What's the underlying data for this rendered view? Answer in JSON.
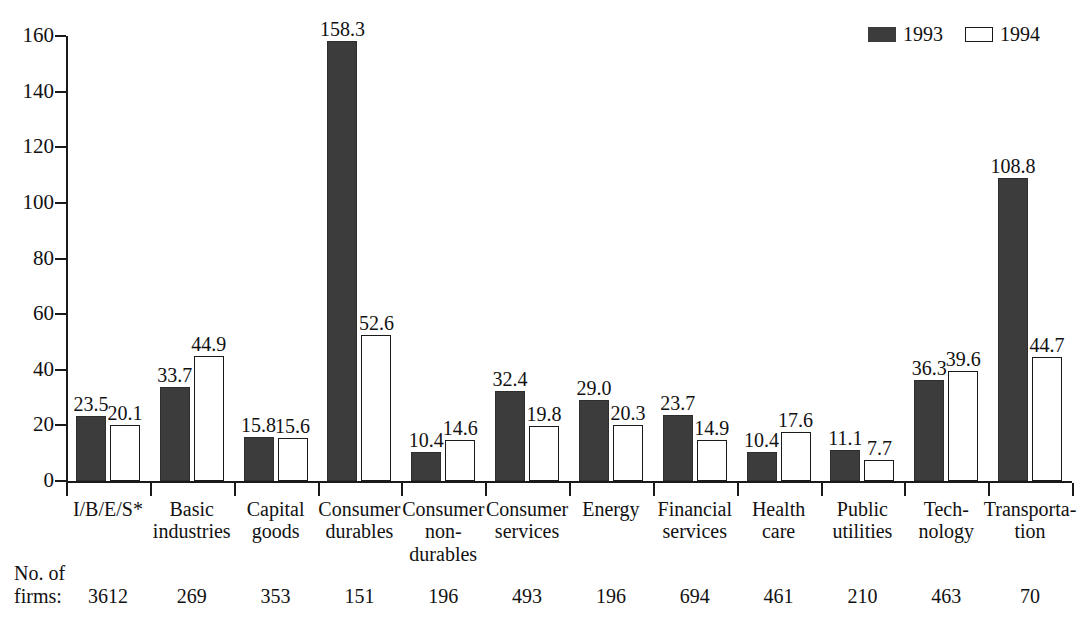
{
  "legend": {
    "entries": [
      {
        "label": "1993",
        "style": "filled",
        "color": "#3c3c3c",
        "icon": "filled-square-swatch"
      },
      {
        "label": "1994",
        "style": "open",
        "color": "#ffffff",
        "icon": "open-square-swatch"
      }
    ]
  },
  "firms_caption": "No. of\nfirms:",
  "chart_data": {
    "type": "bar",
    "title": "",
    "subtitle": "",
    "xlabel": "",
    "ylabel": "",
    "ylim": [
      0,
      160
    ],
    "yticks": [
      0,
      20,
      40,
      60,
      80,
      100,
      120,
      140,
      160
    ],
    "ytick_labels": [
      "0",
      "20",
      "40",
      "60",
      "80",
      "100",
      "120",
      "140",
      "160"
    ],
    "grid": false,
    "legend_position": "top-right",
    "categories": [
      "I/B/E/S*",
      "Basic\nindustries",
      "Capital\ngoods",
      "Consumer\ndurables",
      "Consumer\nnon-\ndurables",
      "Consumer\nservices",
      "Energy",
      "Financial\nservices",
      "Health\ncare",
      "Public\nutilities",
      "Tech-\nnology",
      "Transporta-\ntion"
    ],
    "series": [
      {
        "name": "1993",
        "color": "#3c3c3c",
        "values": [
          23.5,
          33.7,
          15.8,
          158.3,
          10.4,
          32.4,
          29.0,
          23.7,
          10.4,
          11.1,
          36.3,
          108.8
        ],
        "labels": [
          "23.5",
          "33.7",
          "15.8",
          "158.3",
          "10.4",
          "32.4",
          "29.0",
          "23.7",
          "10.4",
          "11.1",
          "36.3",
          "108.8"
        ]
      },
      {
        "name": "1994",
        "color": "#ffffff",
        "values": [
          20.1,
          44.9,
          15.6,
          52.6,
          14.6,
          19.8,
          20.3,
          14.9,
          17.6,
          7.7,
          39.6,
          44.7
        ],
        "labels": [
          "20.1",
          "44.9",
          "15.6",
          "52.6",
          "14.6",
          "19.8",
          "20.3",
          "14.9",
          "17.6",
          "7.7",
          "39.6",
          "44.7"
        ]
      }
    ],
    "annotations": {
      "row_label": "No. of firms:",
      "firms": [
        3612,
        269,
        353,
        151,
        196,
        493,
        196,
        694,
        461,
        210,
        463,
        70
      ],
      "firms_labels": [
        "3612",
        "269",
        "353",
        "151",
        "196",
        "493",
        "196",
        "694",
        "461",
        "210",
        "463",
        "70"
      ]
    }
  }
}
